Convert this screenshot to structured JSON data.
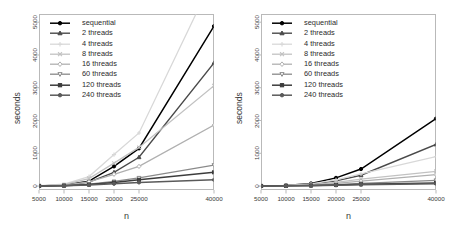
{
  "figure": {
    "background": "#ffffff",
    "axis_color": "#b9b9b9",
    "text_color": "#3a3a3a"
  },
  "series_style": [
    {
      "key": "sequential",
      "label": "sequential",
      "color": "#000000",
      "marker": "circle",
      "filled": true,
      "width": 1.5
    },
    {
      "key": "t2",
      "label": "2 threads",
      "color": "#4a4a4a",
      "marker": "triangle",
      "filled": true,
      "width": 1.4
    },
    {
      "key": "t4",
      "label": "4 threads",
      "color": "#d8d8d8",
      "marker": "plus",
      "filled": false,
      "width": 1.3
    },
    {
      "key": "t8",
      "label": "8 threads",
      "color": "#c2c2c2",
      "marker": "cross",
      "filled": false,
      "width": 1.3
    },
    {
      "key": "t16",
      "label": "16 threads",
      "color": "#b0b0b0",
      "marker": "diamond",
      "filled": false,
      "width": 1.3
    },
    {
      "key": "t60",
      "label": "60 threads",
      "color": "#8a8a8a",
      "marker": "triangle-down",
      "filled": false,
      "width": 1.3
    },
    {
      "key": "t120",
      "label": "120 threads",
      "color": "#3c3c3c",
      "marker": "square",
      "filled": true,
      "width": 1.5
    },
    {
      "key": "t240",
      "label": "240 threads",
      "color": "#5a5a5a",
      "marker": "circle",
      "filled": true,
      "width": 1.5
    }
  ],
  "chart_data": [
    {
      "type": "line",
      "panel": "left",
      "title": "",
      "xlabel": "n",
      "ylabel": "seconds",
      "xticklabels": [
        "5000",
        "10000",
        "15000",
        "20000",
        "25000",
        "40000"
      ],
      "x": [
        5000,
        10000,
        15000,
        20000,
        25000,
        40000
      ],
      "yticklabels": [
        "0",
        "1000",
        "2000",
        "3000",
        "4000",
        "5000"
      ],
      "yticks": [
        0,
        1000,
        2000,
        3000,
        4000,
        5000
      ],
      "ylim": [
        -120,
        5250
      ],
      "grid": false,
      "legend_position": "top-left",
      "series": [
        {
          "name": "sequential",
          "values": [
            5,
            30,
            150,
            600,
            1150,
            4880
          ]
        },
        {
          "name": "2 threads",
          "values": [
            5,
            25,
            120,
            420,
            880,
            3760
          ]
        },
        {
          "name": "4 threads",
          "values": [
            10,
            60,
            290,
            960,
            1620,
            6400
          ]
        },
        {
          "name": "8 threads",
          "values": [
            8,
            45,
            230,
            700,
            1180,
            3060
          ]
        },
        {
          "name": "16 threads",
          "values": [
            5,
            25,
            130,
            360,
            600,
            1860
          ]
        },
        {
          "name": "60 threads",
          "values": [
            4,
            15,
            55,
            140,
            250,
            640
          ]
        },
        {
          "name": "120 threads",
          "values": [
            4,
            12,
            45,
            110,
            190,
            420
          ]
        },
        {
          "name": "240 threads",
          "values": [
            4,
            10,
            30,
            70,
            110,
            190
          ]
        }
      ]
    },
    {
      "type": "line",
      "panel": "right",
      "title": "",
      "xlabel": "n",
      "ylabel": "seconds",
      "xticklabels": [
        "5000",
        "10000",
        "15000",
        "20000",
        "25000",
        "40000"
      ],
      "x": [
        5000,
        10000,
        15000,
        20000,
        25000,
        40000
      ],
      "yticklabels": [
        "0",
        "1000",
        "2000",
        "3000",
        "4000",
        "5000"
      ],
      "yticks": [
        0,
        1000,
        2000,
        3000,
        4000,
        5000
      ],
      "ylim": [
        -120,
        5250
      ],
      "grid": false,
      "legend_position": "top-left",
      "series": [
        {
          "name": "sequential",
          "values": [
            5,
            20,
            80,
            250,
            520,
            2060
          ]
        },
        {
          "name": "2 threads",
          "values": [
            5,
            15,
            55,
            160,
            330,
            1270
          ]
        },
        {
          "name": "4 threads",
          "values": [
            5,
            18,
            65,
            190,
            370,
            900
          ]
        },
        {
          "name": "8 threads",
          "values": [
            5,
            12,
            40,
            110,
            210,
            450
          ]
        },
        {
          "name": "16 threads",
          "values": [
            4,
            10,
            30,
            80,
            150,
            350
          ]
        },
        {
          "name": "60 threads",
          "values": [
            4,
            8,
            20,
            45,
            80,
            175
          ]
        },
        {
          "name": "120 threads",
          "values": [
            4,
            7,
            15,
            32,
            55,
            95
          ]
        },
        {
          "name": "240 threads",
          "values": [
            4,
            6,
            12,
            25,
            42,
            70
          ]
        }
      ]
    }
  ]
}
